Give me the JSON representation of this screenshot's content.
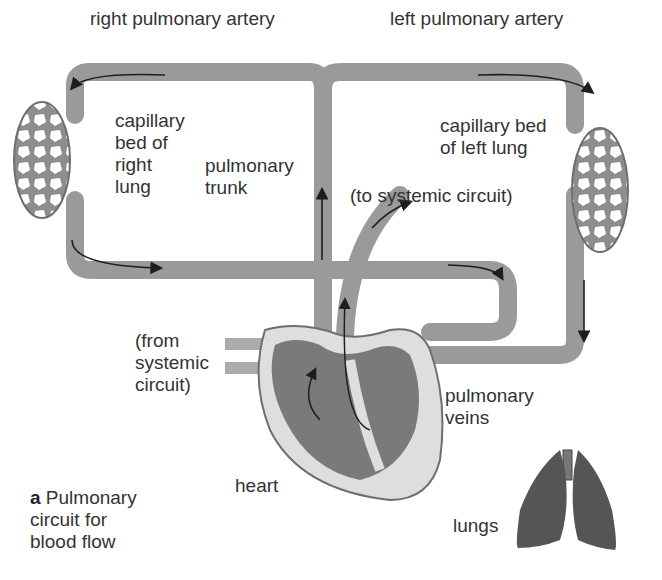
{
  "labels": {
    "right_pulmonary_artery": "right pulmonary artery",
    "left_pulmonary_artery": "left pulmonary artery",
    "capillary_right": "capillary\nbed of\nright\nlung",
    "capillary_left": "capillary bed\nof left lung",
    "pulmonary_trunk": "pulmonary\ntrunk",
    "to_systemic": "(to systemic circuit)",
    "from_systemic": "(from\nsystemic\ncircuit)",
    "pulmonary_veins": "pulmonary\nveins",
    "heart": "heart",
    "lungs": "lungs"
  },
  "caption": {
    "letter": "a",
    "text": "Pulmonary\ncircuit for\nblood flow"
  },
  "colors": {
    "vessel": "#9a9a9a",
    "vessel_edge": "#6e6e6e",
    "heart_outer": "#dedede",
    "heart_inner": "#7a7a7a",
    "lungs": "#5a5a5a",
    "arrow": "#1e1e1e"
  }
}
